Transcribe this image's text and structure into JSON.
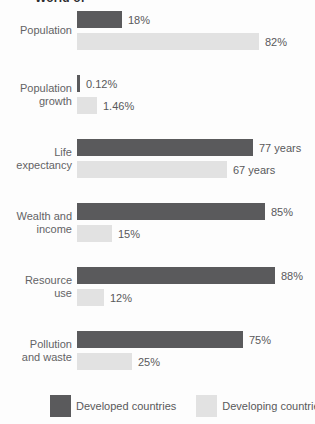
{
  "title_fragment": "World of",
  "colors": {
    "developed": "#5a5a5c",
    "developing": "#e2e2e2",
    "text": "#59595b"
  },
  "legend": {
    "developed_label": "Developed countries",
    "developing_label": "Developing countries"
  },
  "chart_data": {
    "type": "bar",
    "orientation": "horizontal",
    "grid": false,
    "legend_position": "bottom",
    "title_fragment": "World of",
    "categories": [
      "Population",
      "Population growth",
      "Life expectancy",
      "Wealth and income",
      "Resource use",
      "Pollution and waste"
    ],
    "series": [
      {
        "name": "Developed countries",
        "values": [
          18,
          0.12,
          77,
          85,
          88,
          75
        ],
        "units": [
          "%",
          "%",
          "years",
          "%",
          "%",
          "%"
        ]
      },
      {
        "name": "Developing countries",
        "values": [
          82,
          1.46,
          67,
          15,
          12,
          25
        ],
        "units": [
          "%",
          "%",
          "years",
          "%",
          "%",
          "%"
        ]
      }
    ],
    "rows": [
      {
        "label_lines": [
          "Population"
        ],
        "developed": {
          "label": "18%",
          "bar_px": 45
        },
        "developing": {
          "label": "82%",
          "bar_px": 182
        }
      },
      {
        "label_lines": [
          "Population",
          "growth"
        ],
        "developed": {
          "label": "0.12%",
          "bar_px": 3
        },
        "developing": {
          "label": "1.46%",
          "bar_px": 20
        }
      },
      {
        "label_lines": [
          "Life",
          "expectancy"
        ],
        "developed": {
          "label": "77 years",
          "bar_px": 176
        },
        "developing": {
          "label": "67 years",
          "bar_px": 150
        }
      },
      {
        "label_lines": [
          "Wealth and",
          "income"
        ],
        "developed": {
          "label": "85%",
          "bar_px": 188
        },
        "developing": {
          "label": "15%",
          "bar_px": 35
        }
      },
      {
        "label_lines": [
          "Resource",
          "use"
        ],
        "developed": {
          "label": "88%",
          "bar_px": 198
        },
        "developing": {
          "label": "12%",
          "bar_px": 27
        }
      },
      {
        "label_lines": [
          "Pollution",
          "and waste"
        ],
        "developed": {
          "label": "75%",
          "bar_px": 166
        },
        "developing": {
          "label": "25%",
          "bar_px": 55
        }
      }
    ]
  }
}
